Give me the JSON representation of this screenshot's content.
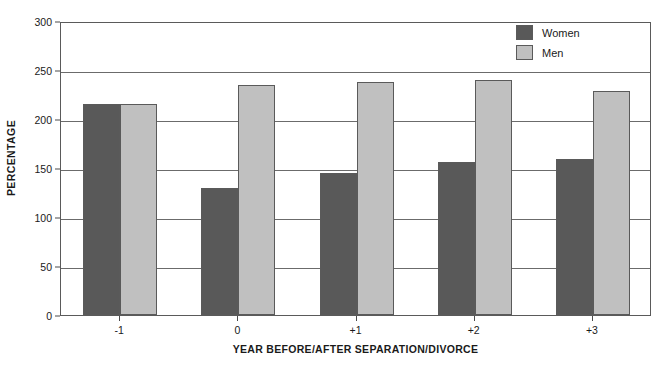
{
  "chart_data": {
    "type": "bar",
    "title": "",
    "subtitle": "",
    "xlabel": "YEAR BEFORE/AFTER SEPARATION/DIVORCE",
    "ylabel": "PERCENTAGE",
    "categories": [
      "-1",
      "0",
      "+1",
      "+2",
      "+3"
    ],
    "series": [
      {
        "name": "Women",
        "color": "#595959",
        "values": [
          215,
          130,
          145,
          156,
          159
        ]
      },
      {
        "name": "Men",
        "color": "#c0c0c0",
        "values": [
          215,
          235,
          238,
          240,
          229
        ]
      }
    ],
    "ylim": [
      0,
      300
    ],
    "ytick_values": [
      0,
      50,
      100,
      150,
      200,
      250,
      300
    ],
    "ytick_labels": [
      "0",
      "50",
      "100",
      "150",
      "200",
      "250",
      "300"
    ],
    "grid": "horizontal",
    "legend_position": "top-right"
  },
  "legend": {
    "entries": [
      {
        "label": "Women",
        "swatch": "dark-gray-swatch"
      },
      {
        "label": "Men",
        "swatch": "light-gray-swatch"
      }
    ]
  }
}
